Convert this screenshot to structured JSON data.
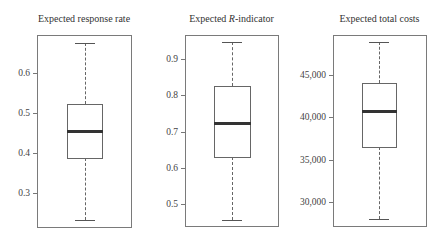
{
  "chart_data": [
    {
      "type": "boxplot",
      "title": "Expected response rate",
      "title_parts": [
        "Expected response rate"
      ],
      "yticks": [
        0.3,
        0.4,
        0.5,
        0.6
      ],
      "ytick_labels": [
        "0.3",
        "0.4",
        "0.5",
        "0.6"
      ],
      "ylim": [
        0.22,
        0.7
      ],
      "whisker_low": 0.233,
      "q1": 0.388,
      "median": 0.455,
      "q3": 0.522,
      "whisker_high": 0.675,
      "grid": false
    },
    {
      "type": "boxplot",
      "title": "Expected R-indicator",
      "title_parts": [
        "Expected ",
        "R",
        "-indicator"
      ],
      "yticks": [
        0.5,
        0.6,
        0.7,
        0.8,
        0.9
      ],
      "ytick_labels": [
        "0.5",
        "0.6",
        "0.7",
        "0.8",
        "0.9"
      ],
      "ylim": [
        0.44,
        0.97
      ],
      "whisker_low": 0.456,
      "q1": 0.631,
      "median": 0.723,
      "q3": 0.825,
      "whisker_high": 0.948,
      "grid": false
    },
    {
      "type": "boxplot",
      "title": "Expected total costs",
      "title_parts": [
        "Expected total costs"
      ],
      "yticks": [
        30000,
        35000,
        40000,
        45000
      ],
      "ytick_labels": [
        "30,000",
        "35,000",
        "40,000",
        "45,000"
      ],
      "ylim": [
        27200,
        49800
      ],
      "whisker_low": 28000,
      "q1": 36450,
      "median": 40700,
      "q3": 44100,
      "whisker_high": 48900,
      "grid": false
    }
  ],
  "layout": [
    {
      "frame": [
        37,
        35,
        131,
        227
      ],
      "box_x": [
        67,
        102
      ],
      "ref": [
        [
          0.6,
          73
        ],
        [
          0.3,
          193
        ]
      ]
    },
    {
      "frame": [
        185,
        35,
        278,
        226
      ],
      "box_x": [
        214,
        250
      ],
      "ref": [
        [
          0.9,
          59
        ],
        [
          0.5,
          204
        ]
      ]
    },
    {
      "frame": [
        333,
        35,
        426,
        226
      ],
      "box_x": [
        362,
        396
      ],
      "ref": [
        [
          45000,
          75
        ],
        [
          30000,
          202
        ]
      ]
    }
  ]
}
